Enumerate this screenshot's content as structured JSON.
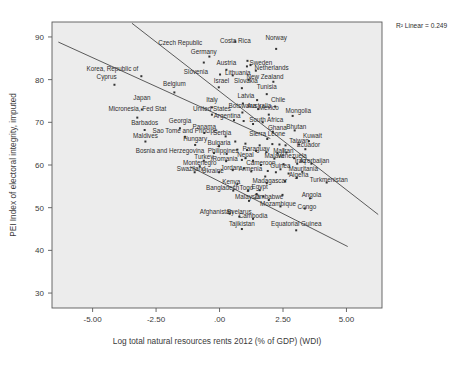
{
  "figure": {
    "r2_label": "R² Linear = 0.249",
    "xlabel": "Log total natural resources rents 2012 (% of GDP) (WDI)",
    "ylabel": "PEI Index of electoral integrity, imputed",
    "caption": "",
    "background_color": "#ececec",
    "point_color": "#333333",
    "line_color": "#4a4a4a"
  },
  "chart_data": {
    "type": "scatter",
    "title": "",
    "xlabel": "Log total natural resources rents 2012 (% of GDP) (WDI)",
    "ylabel": "PEI Index of electoral integrity, imputed",
    "xlim": [
      -6.6,
      6.4
    ],
    "ylim": [
      26.5,
      93.5
    ],
    "xticks": [
      "-5.00",
      "-2.50",
      ".00",
      "2.50",
      "5.00"
    ],
    "xtick_values": [
      -5.0,
      -2.5,
      0.0,
      2.5,
      5.0
    ],
    "yticks": [
      "30",
      "40",
      "50",
      "60",
      "70",
      "80",
      "90"
    ],
    "ytick_values": [
      30,
      40,
      50,
      60,
      70,
      80,
      90
    ],
    "grid": false,
    "legend": "none",
    "r2_linear": 0.249,
    "annotations": [
      "R² Linear = 0.249"
    ],
    "fit_lines": [
      {
        "name": "upper-fit-line",
        "x0": -6.35,
        "y0": 88.8,
        "x1": 2.0,
        "y1": 66.2
      },
      {
        "name": "middle-fit-line",
        "x0": -3.45,
        "y0": 93.2,
        "x1": 6.25,
        "y1": 48.4
      },
      {
        "name": "lower-fit-line",
        "x0": -1.15,
        "y0": 59.6,
        "x1": 5.05,
        "y1": 40.9
      }
    ],
    "points": [
      {
        "label": "Czech Republic",
        "x": -0.4,
        "y": 85.4,
        "lx": -1.55,
        "ly": 88.2
      },
      {
        "label": "Costa Rica",
        "x": 0.62,
        "y": 88.9,
        "lx": 0.62,
        "ly": 88.6
      },
      {
        "label": "Norway",
        "x": 2.23,
        "y": 87.2,
        "lx": 2.23,
        "ly": 89.4
      },
      {
        "label": "Germany",
        "x": -0.62,
        "y": 84.0,
        "lx": -0.62,
        "ly": 86.1
      },
      {
        "label": "Sweden",
        "x": 1.22,
        "y": 83.4,
        "lx": 1.63,
        "ly": 83.5
      },
      {
        "label": "Netherlands",
        "x": 1.43,
        "y": 82.1,
        "lx": 2.05,
        "ly": 82.2
      },
      {
        "label": "Austria",
        "x": 0.27,
        "y": 82.3,
        "lx": 0.27,
        "ly": 83.5
      },
      {
        "label": "Korea, Republic of",
        "x": -3.08,
        "y": 80.8,
        "lx": -4.22,
        "ly": 82.1
      },
      {
        "label": "Slovenia",
        "x": 0.02,
        "y": 81.2,
        "lx": -0.93,
        "ly": 81.3
      },
      {
        "label": "Lithuania",
        "x": 0.52,
        "y": 81.0,
        "lx": 0.72,
        "ly": 81.1
      },
      {
        "label": "New Zealand",
        "x": 1.15,
        "y": 80.0,
        "lx": 1.79,
        "ly": 80.1
      },
      {
        "label": "Cyprus",
        "x": -4.14,
        "y": 78.8,
        "lx": -4.45,
        "ly": 80.1
      },
      {
        "label": "Belgium",
        "x": -1.78,
        "y": 77.0,
        "lx": -1.78,
        "ly": 78.4
      },
      {
        "label": "Israel",
        "x": -0.03,
        "y": 78.2,
        "lx": 0.08,
        "ly": 79.3
      },
      {
        "label": "Slovakia",
        "x": 0.88,
        "y": 78.0,
        "lx": 1.04,
        "ly": 79.3
      },
      {
        "label": "Tunisia",
        "x": 1.86,
        "y": 76.6,
        "lx": 1.86,
        "ly": 77.7
      },
      {
        "label": "Japan",
        "x": -3.06,
        "y": 73.0,
        "lx": -3.06,
        "ly": 75.2
      },
      {
        "label": "Italy",
        "x": -0.3,
        "y": 73.5,
        "lx": -0.3,
        "ly": 74.8
      },
      {
        "label": "Latvia",
        "x": 0.92,
        "y": 74.4,
        "lx": 1.04,
        "ly": 75.6
      },
      {
        "label": "Australia",
        "x": 1.52,
        "y": 73.1,
        "lx": 1.56,
        "ly": 73.3
      },
      {
        "label": "Chile",
        "x": 2.19,
        "y": 73.7,
        "lx": 2.31,
        "ly": 74.7
      },
      {
        "label": "Micronesia, Fed Stat",
        "x": -3.24,
        "y": 71.1,
        "lx": -3.24,
        "ly": 72.6
      },
      {
        "label": "United States",
        "x": -0.3,
        "y": 71.8,
        "lx": -0.3,
        "ly": 72.6
      },
      {
        "label": "Botswana",
        "x": 0.9,
        "y": 72.3,
        "lx": 0.9,
        "ly": 73.4
      },
      {
        "label": "Mexico",
        "x": 1.94,
        "y": 71.8,
        "lx": 1.94,
        "ly": 72.8
      },
      {
        "label": "Mongolia",
        "x": 2.88,
        "y": 71.5,
        "lx": 3.1,
        "ly": 72.2
      },
      {
        "label": "Argentina",
        "x": 0.57,
        "y": 70.5,
        "lx": 0.3,
        "ly": 70.9
      },
      {
        "label": "South Africa",
        "x": 1.7,
        "y": 70.0,
        "lx": 1.84,
        "ly": 70.1
      },
      {
        "label": "Barbados",
        "x": -2.95,
        "y": 68.2,
        "lx": -2.95,
        "ly": 69.4
      },
      {
        "label": "Georgia",
        "x": -1.56,
        "y": 68.6,
        "lx": -1.56,
        "ly": 69.8
      },
      {
        "label": "Panama",
        "x": -0.6,
        "y": 67.5,
        "lx": -0.6,
        "ly": 68.5
      },
      {
        "label": "Ghana",
        "x": 2.1,
        "y": 67.8,
        "lx": 2.28,
        "ly": 68.3
      },
      {
        "label": "Bhutan",
        "x": 2.96,
        "y": 68.1,
        "lx": 3.02,
        "ly": 68.5
      },
      {
        "label": "Sierra Leone",
        "x": 1.88,
        "y": 66.1,
        "lx": 1.88,
        "ly": 66.9
      },
      {
        "label": "Maldives",
        "x": -2.92,
        "y": 65.5,
        "lx": -2.92,
        "ly": 66.4
      },
      {
        "label": "Sao Tome and Principe",
        "x": -1.36,
        "y": 66.6,
        "lx": -1.36,
        "ly": 67.4
      },
      {
        "label": "Serbia",
        "x": 0.24,
        "y": 66.7,
        "lx": 0.1,
        "ly": 67.0
      },
      {
        "label": "Kuwait",
        "x": 3.52,
        "y": 65.6,
        "lx": 3.66,
        "ly": 66.3
      },
      {
        "label": "Hungary",
        "x": -0.96,
        "y": 64.7,
        "lx": -0.96,
        "ly": 65.6
      },
      {
        "label": "Bulgaria",
        "x": -0.02,
        "y": 64.4,
        "lx": -0.02,
        "ly": 64.6
      },
      {
        "label": "Ecuador",
        "x": 3.38,
        "y": 63.7,
        "lx": 3.5,
        "ly": 64.2
      },
      {
        "label": "Bosnia and Herzegovina",
        "x": -0.22,
        "y": 62.8,
        "lx": -1.95,
        "ly": 62.9
      },
      {
        "label": "Philippines",
        "x": 0.28,
        "y": 62.6,
        "lx": 0.14,
        "ly": 62.8
      },
      {
        "label": "Paraguay",
        "x": 1.44,
        "y": 63.3,
        "lx": 1.44,
        "ly": 63.3
      },
      {
        "label": "Mali",
        "x": 2.28,
        "y": 62.8,
        "lx": 2.34,
        "ly": 62.9
      },
      {
        "label": "Iran",
        "x": 2.63,
        "y": 62.9,
        "lx": 2.7,
        "ly": 62.9
      },
      {
        "label": "Taiwan",
        "x": 3.13,
        "y": 64.8,
        "lx": 3.13,
        "ly": 65.2
      },
      {
        "label": "Venezuela",
        "x": 2.94,
        "y": 61.6,
        "lx": 2.86,
        "ly": 61.6
      },
      {
        "label": "Turkey",
        "x": -0.62,
        "y": 61.0,
        "lx": -0.62,
        "ly": 61.3
      },
      {
        "label": "Romania",
        "x": 0.26,
        "y": 60.9,
        "lx": 0.22,
        "ly": 61.0
      },
      {
        "label": "Nepal",
        "x": 1.02,
        "y": 61.6,
        "lx": 1.02,
        "ly": 61.8
      },
      {
        "label": "Malawi",
        "x": 2.16,
        "y": 61.5,
        "lx": 2.16,
        "ly": 61.6
      },
      {
        "label": "Montenegro",
        "x": -0.78,
        "y": 59.7,
        "lx": -0.78,
        "ly": 60.0
      },
      {
        "label": "Cameroon",
        "x": 1.63,
        "y": 60.0,
        "lx": 1.63,
        "ly": 60.1
      },
      {
        "label": "Iraq",
        "x": 3.06,
        "y": 60.3,
        "lx": 3.18,
        "ly": 60.4
      },
      {
        "label": "Azerbaijan",
        "x": 3.62,
        "y": 60.3,
        "lx": 3.74,
        "ly": 60.4
      },
      {
        "label": "Swaziland",
        "x": -0.98,
        "y": 58.3,
        "lx": -1.12,
        "ly": 58.5
      },
      {
        "label": "Ukraine",
        "x": -0.02,
        "y": 58.3,
        "lx": -0.26,
        "ly": 58.2
      },
      {
        "label": "Jordan",
        "x": 0.52,
        "y": 58.8,
        "lx": 0.42,
        "ly": 58.9
      },
      {
        "label": "Armenia",
        "x": 1.25,
        "y": 58.5,
        "lx": 1.22,
        "ly": 58.5
      },
      {
        "label": "Guinea",
        "x": 2.4,
        "y": 59.0,
        "lx": 2.4,
        "ly": 59.2
      },
      {
        "label": "Mauritania",
        "x": 3.26,
        "y": 58.4,
        "lx": 3.3,
        "ly": 58.5
      },
      {
        "label": "Algeria",
        "x": 3.04,
        "y": 57.0,
        "lx": 3.12,
        "ly": 57.2
      },
      {
        "label": "Kenya",
        "x": 0.7,
        "y": 55.5,
        "lx": 0.46,
        "ly": 55.6
      },
      {
        "label": "Madagascar",
        "x": 1.86,
        "y": 55.8,
        "lx": 1.98,
        "ly": 55.9
      },
      {
        "label": "Bangladesh",
        "x": 0.54,
        "y": 54.0,
        "lx": 0.12,
        "ly": 54.2
      },
      {
        "label": "Togo",
        "x": 1.12,
        "y": 54.0,
        "lx": 1.06,
        "ly": 54.2
      },
      {
        "label": "Egypt",
        "x": 1.58,
        "y": 54.1,
        "lx": 1.58,
        "ly": 54.4
      },
      {
        "label": "Turkmenistan",
        "x": 4.22,
        "y": 55.9,
        "lx": 4.3,
        "ly": 56.1
      },
      {
        "label": "Malaysia",
        "x": 1.16,
        "y": 51.6,
        "lx": 1.1,
        "ly": 52.1
      },
      {
        "label": "Zimbabwe",
        "x": 1.94,
        "y": 51.8,
        "lx": 1.94,
        "ly": 52.1
      },
      {
        "label": "Angola",
        "x": 3.56,
        "y": 52.2,
        "lx": 3.62,
        "ly": 52.6
      },
      {
        "label": "Mozambique",
        "x": 2.4,
        "y": 50.3,
        "lx": 2.3,
        "ly": 50.3
      },
      {
        "label": "Congo",
        "x": 3.36,
        "y": 49.8,
        "lx": 3.44,
        "ly": 49.8
      },
      {
        "label": "Afghanistan",
        "x": 0.4,
        "y": 48.6,
        "lx": -0.12,
        "ly": 48.6
      },
      {
        "label": "Byelarus",
        "x": 0.78,
        "y": 47.9,
        "lx": 0.78,
        "ly": 48.6
      },
      {
        "label": "Cambodia",
        "x": 1.32,
        "y": 47.4,
        "lx": 1.32,
        "ly": 47.5
      },
      {
        "label": "Tajikistan",
        "x": 0.88,
        "y": 45.0,
        "lx": 0.88,
        "ly": 45.7
      },
      {
        "label": "Equatorial Guinea",
        "x": 3.02,
        "y": 44.7,
        "lx": 3.02,
        "ly": 45.6
      }
    ],
    "extra_points": [
      {
        "x": 1.1,
        "y": 84.4
      },
      {
        "x": 1.08,
        "y": 83.1
      },
      {
        "x": 2.12,
        "y": 79.5
      },
      {
        "x": 1.48,
        "y": 75.2
      },
      {
        "x": 0.95,
        "y": 70.3
      },
      {
        "x": 1.32,
        "y": 69.6
      },
      {
        "x": 0.62,
        "y": 65.5
      },
      {
        "x": 1.02,
        "y": 65.0
      },
      {
        "x": 1.58,
        "y": 64.6
      },
      {
        "x": 2.08,
        "y": 64.9
      },
      {
        "x": 2.36,
        "y": 64.8
      },
      {
        "x": 2.6,
        "y": 64.6
      },
      {
        "x": 0.7,
        "y": 63.6
      },
      {
        "x": 1.08,
        "y": 63.5
      },
      {
        "x": 1.84,
        "y": 63.0
      },
      {
        "x": 0.88,
        "y": 61.2
      },
      {
        "x": 1.32,
        "y": 61.0
      },
      {
        "x": 2.52,
        "y": 60.2
      },
      {
        "x": 0.96,
        "y": 59.2
      },
      {
        "x": 1.9,
        "y": 58.6
      },
      {
        "x": 2.22,
        "y": 58.3
      },
      {
        "x": 2.72,
        "y": 58.0
      },
      {
        "x": 1.8,
        "y": 57.3
      },
      {
        "x": 2.58,
        "y": 56.2
      },
      {
        "x": 1.46,
        "y": 53.2
      },
      {
        "x": 1.72,
        "y": 52.6
      },
      {
        "x": 2.48,
        "y": 53.0
      }
    ]
  }
}
